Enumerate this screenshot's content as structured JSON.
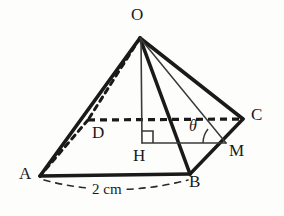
{
  "figure": {
    "kind": "geometry-diagram",
    "background_color": "#fdfdfc",
    "ink_color": "#1a1a1a",
    "vertices": [
      {
        "id": "O",
        "label": "O",
        "x": 140,
        "y": 38,
        "label_x": 131,
        "label_y": 10
      },
      {
        "id": "A",
        "label": "A",
        "x": 40,
        "y": 176,
        "label_x": 20,
        "label_y": 173
      },
      {
        "id": "B",
        "label": "B",
        "x": 190,
        "y": 174,
        "label_x": 189,
        "label_y": 177
      },
      {
        "id": "C",
        "label": "C",
        "x": 243,
        "y": 119,
        "label_x": 251,
        "label_y": 106
      },
      {
        "id": "D",
        "label": "D",
        "x": 88,
        "y": 120,
        "label_x": 92,
        "label_y": 124
      },
      {
        "id": "H",
        "label": "H",
        "x": 142,
        "y": 142,
        "label_x": 134,
        "label_y": 147
      },
      {
        "id": "M",
        "label": "M",
        "x": 226,
        "y": 143,
        "label_x": 229,
        "label_y": 143
      }
    ],
    "angle": {
      "id": "theta",
      "label": "θ",
      "label_x": 190,
      "label_y": 121,
      "at_vertex": "M",
      "between": [
        "M-H",
        "M-O"
      ]
    },
    "measurements": [
      {
        "id": "base-edge-AB",
        "label": "2 cm",
        "label_x": 92,
        "label_y": 184,
        "from": "A",
        "to": "B"
      }
    ],
    "edges": [
      {
        "id": "O-A",
        "style": "solid-thick"
      },
      {
        "id": "O-B",
        "style": "solid-thick"
      },
      {
        "id": "O-C",
        "style": "solid-thick"
      },
      {
        "id": "O-D",
        "style": "dashed-thick"
      },
      {
        "id": "A-B",
        "style": "solid-thick"
      },
      {
        "id": "B-C",
        "style": "solid-thick"
      },
      {
        "id": "C-D",
        "style": "dashed-thick"
      },
      {
        "id": "D-A",
        "style": "dashed-thick"
      },
      {
        "id": "O-H",
        "style": "solid-thin"
      },
      {
        "id": "O-M",
        "style": "solid-thin"
      },
      {
        "id": "H-M",
        "style": "solid-thin"
      }
    ],
    "right_angle_marker": {
      "at": "H",
      "size": 11
    }
  }
}
